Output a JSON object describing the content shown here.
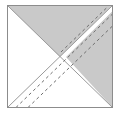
{
  "figure": {
    "title": "Half-square triangle block with dashed stitching lines",
    "type": "geometric-diagram",
    "canvas": {
      "width": 120,
      "height": 117,
      "background": "#ffffff"
    },
    "square": {
      "name": "block-outline",
      "left": 7.5,
      "top": 5.5,
      "right": 112.5,
      "bottom": 107.5,
      "border_color": "#8c8c8c",
      "border_width": 1,
      "fill": "#ffffff"
    },
    "colors": {
      "fabric_gray": "#c9c9c9",
      "fabric_gray_edge": "#9a9a9a",
      "background_white": "#ffffff",
      "outline": "#8c8c8c",
      "dash_line": "#6e6e6e"
    },
    "shapes": [
      {
        "name": "upper-left-gray-triangle",
        "role": "shaded fabric patch",
        "fill": "#c9c9c9",
        "points": "7.5,5.5 112.5,5.5 60,57"
      },
      {
        "name": "right-gray-triangle",
        "role": "shaded fabric patch",
        "fill": "#c9c9c9",
        "points": "66,57 112.5,11 112.5,107.5"
      },
      {
        "name": "left-white-triangle",
        "role": "background fabric patch",
        "fill": "#ffffff",
        "points": "7.5,5.5 60,57 7.5,107.5"
      },
      {
        "name": "bottom-white-triangle",
        "role": "background fabric patch",
        "fill": "#ffffff",
        "points": "7.5,107.5 60,57 112.5,107.5"
      }
    ],
    "diagonals": [
      {
        "name": "main-diagonal",
        "style": "solid",
        "color": "#8c8c8c",
        "from": [
          7.5,
          107.5
        ],
        "to": [
          112.5,
          5.5
        ]
      },
      {
        "name": "anti-diagonal",
        "style": "solid",
        "color": "#8c8c8c",
        "from": [
          7.5,
          5.5
        ],
        "to": [
          112.5,
          107.5
        ]
      }
    ],
    "dashed_lines": [
      {
        "name": "stitch-line-upper",
        "style": "dashed",
        "color": "#6e6e6e",
        "offset_label": "above diagonal",
        "from": [
          16,
          107.5
        ],
        "to": [
          112.5,
          14
        ]
      },
      {
        "name": "stitch-line-lower",
        "style": "dashed",
        "color": "#6e6e6e",
        "offset_label": "below diagonal",
        "from": [
          28,
          107.5
        ],
        "to": [
          112.5,
          26
        ]
      },
      {
        "name": "stitch-line-top-right",
        "style": "dashed",
        "color": "#6e6e6e",
        "offset_label": "upper right corner",
        "from": [
          60,
          51
        ],
        "to": [
          107,
          5.5
        ]
      }
    ],
    "dash_pattern": "3 3",
    "dash_width": 1
  }
}
